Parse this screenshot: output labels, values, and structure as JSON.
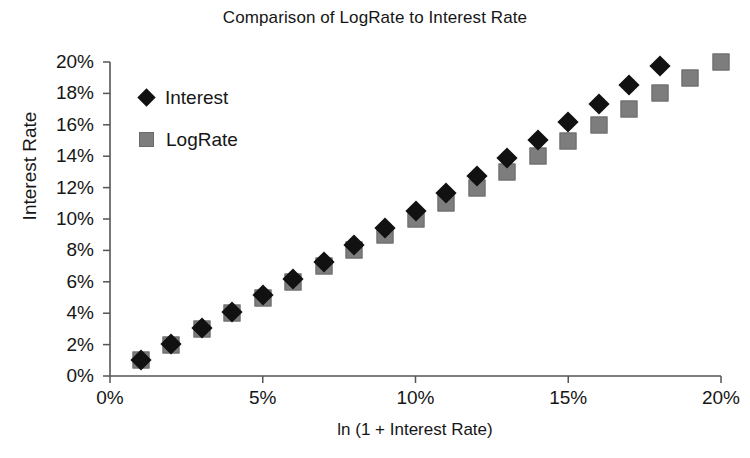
{
  "chart_data": {
    "type": "scatter",
    "title": "Comparison of LogRate to Interest Rate",
    "xlabel": "ln (1 + Interest Rate)",
    "ylabel": "Interest Rate",
    "xlim": [
      0,
      20
    ],
    "ylim": [
      0,
      20
    ],
    "grid": false,
    "legend_position": "upper-left-inside",
    "xtick_labels": [
      "0%",
      "5%",
      "10%",
      "15%",
      "20%"
    ],
    "xtick_values": [
      0,
      5,
      10,
      15,
      20
    ],
    "ytick_labels": [
      "0%",
      "2%",
      "4%",
      "6%",
      "8%",
      "10%",
      "12%",
      "14%",
      "16%",
      "18%",
      "20%"
    ],
    "ytick_values": [
      0,
      2,
      4,
      6,
      8,
      10,
      12,
      14,
      16,
      18,
      20
    ],
    "x": [
      1,
      2,
      3,
      4,
      5,
      6,
      7,
      8,
      9,
      10,
      11,
      12,
      13,
      14,
      15,
      16,
      17,
      18,
      19,
      20
    ],
    "series": [
      {
        "name": "Interest",
        "marker": "diamond",
        "color": "#111111",
        "values": [
          1.01,
          2.02,
          3.05,
          4.08,
          5.13,
          6.18,
          7.25,
          8.33,
          9.42,
          10.52,
          11.63,
          12.75,
          13.88,
          15.03,
          16.18,
          17.35,
          18.53,
          19.72,
          20.92,
          22.14
        ]
      },
      {
        "name": "LogRate",
        "marker": "square",
        "color": "#7d7d7d",
        "values": [
          1.0,
          2.0,
          3.0,
          4.0,
          5.0,
          6.0,
          7.0,
          8.0,
          9.0,
          10.0,
          11.0,
          12.0,
          13.0,
          14.0,
          15.0,
          16.0,
          17.0,
          18.0,
          19.0,
          20.0
        ]
      }
    ]
  },
  "legend": {
    "items": [
      {
        "label": "Interest",
        "marker": "diamond"
      },
      {
        "label": "LogRate",
        "marker": "square"
      }
    ]
  }
}
